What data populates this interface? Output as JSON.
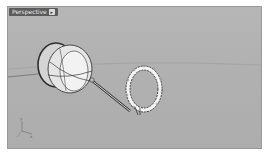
{
  "viewport": {
    "title": "Perspective",
    "menu_caret": "▸",
    "background_color": "#b3b3b3"
  },
  "scene": {
    "objects": [
      {
        "name": "handle-body",
        "type": "revolved-surface"
      },
      {
        "name": "shaft",
        "type": "rod"
      },
      {
        "name": "ring",
        "type": "torus",
        "state": "selected"
      }
    ],
    "axis_labels": {
      "x": "x",
      "y": "y"
    }
  }
}
